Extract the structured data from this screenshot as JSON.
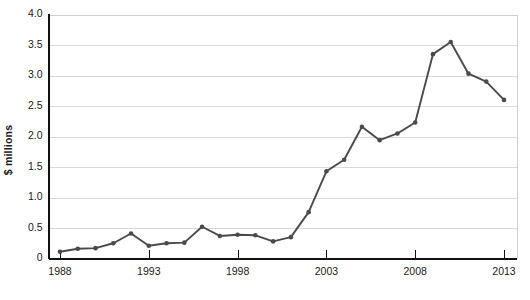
{
  "chart_data": {
    "type": "line",
    "title": "",
    "xlabel": "",
    "ylabel": "$ millions",
    "xlim": [
      1988,
      2013
    ],
    "ylim": [
      0,
      4.0
    ],
    "grid": true,
    "legend": "none",
    "ytick_labels": [
      "4.0",
      "3.5",
      "3.0",
      "2.5",
      "2.0",
      "1.5",
      "1.0",
      "0.5",
      "0"
    ],
    "ytick_values": [
      4.0,
      3.5,
      3.0,
      2.5,
      2.0,
      1.5,
      1.0,
      0.5,
      0
    ],
    "xtick_labels": [
      "1988",
      "1993",
      "1998",
      "2003",
      "2008",
      "2013"
    ],
    "xtick_values": [
      1988,
      1993,
      1998,
      2003,
      2008,
      2013
    ],
    "series_color": "#4a4a4a",
    "grid_color": "#d9d9d9",
    "axis_color": "#111111",
    "marker": "circle",
    "x": [
      1988,
      1989,
      1990,
      1991,
      1992,
      1993,
      1994,
      1995,
      1996,
      1997,
      1998,
      1999,
      2000,
      2001,
      2002,
      2003,
      2004,
      2005,
      2006,
      2007,
      2008,
      2009,
      2010,
      2011,
      2012,
      2013
    ],
    "values": [
      0.11,
      0.16,
      0.17,
      0.25,
      0.41,
      0.21,
      0.25,
      0.26,
      0.52,
      0.37,
      0.39,
      0.38,
      0.28,
      0.35,
      0.76,
      1.43,
      1.62,
      2.16,
      1.94,
      2.05,
      2.23,
      3.35,
      3.55,
      3.03,
      2.9,
      2.6
    ]
  }
}
